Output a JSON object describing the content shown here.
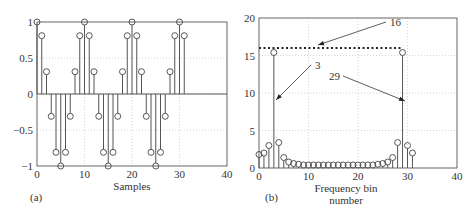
{
  "chart_data": [
    {
      "panel_label": "(a)",
      "type": "stem",
      "title": "",
      "xlabel": "Samples",
      "ylabel": "",
      "xlim": [
        0,
        40
      ],
      "ylim": [
        -1,
        1
      ],
      "xticks": [
        0,
        10,
        20,
        30,
        40
      ],
      "yticks": [
        1,
        0.5,
        0,
        -0.5,
        -1
      ],
      "ytick_labels": [
        "1",
        "0.5",
        "0",
        "−0.5",
        "−1"
      ],
      "grid": true,
      "x": [
        0,
        1,
        2,
        3,
        4,
        5,
        6,
        7,
        8,
        9,
        10,
        11,
        12,
        13,
        14,
        15,
        16,
        17,
        18,
        19,
        20,
        21,
        22,
        23,
        24,
        25,
        26,
        27,
        28,
        29,
        30,
        31
      ],
      "values": [
        1,
        0.81,
        0.31,
        -0.31,
        -0.81,
        -1,
        -0.81,
        -0.31,
        0.31,
        0.81,
        1,
        0.81,
        0.31,
        -0.31,
        -0.81,
        -1,
        -0.81,
        -0.31,
        0.31,
        0.81,
        1,
        0.81,
        0.31,
        -0.31,
        -0.81,
        -1,
        -0.81,
        -0.31,
        0.31,
        0.81,
        1,
        0.81
      ]
    },
    {
      "panel_label": "(b)",
      "type": "stem",
      "title": "",
      "xlabel": "Frequency bin number",
      "xlabel_lines": [
        "Frequency bin",
        "number"
      ],
      "ylabel": "",
      "xlim": [
        0,
        40
      ],
      "ylim": [
        0,
        20
      ],
      "xticks": [
        0,
        10,
        20,
        30,
        40
      ],
      "yticks": [
        20,
        15,
        10,
        5,
        0
      ],
      "grid": true,
      "x": [
        0,
        1,
        2,
        3,
        4,
        5,
        6,
        7,
        8,
        9,
        10,
        11,
        12,
        13,
        14,
        15,
        16,
        17,
        18,
        19,
        20,
        21,
        22,
        23,
        24,
        25,
        26,
        27,
        28,
        29,
        30,
        31
      ],
      "values": [
        1.8,
        2.0,
        3.0,
        15.4,
        3.4,
        1.4,
        0.8,
        0.6,
        0.5,
        0.4,
        0.4,
        0.4,
        0.4,
        0.4,
        0.4,
        0.4,
        0.4,
        0.4,
        0.4,
        0.4,
        0.4,
        0.4,
        0.4,
        0.4,
        0.5,
        0.6,
        0.8,
        1.4,
        3.4,
        15.4,
        3.0,
        2.0
      ],
      "reference_line": {
        "y": 16,
        "x_range": [
          0,
          29
        ],
        "style": "dotted"
      },
      "annotations": [
        {
          "text": "16",
          "text_xy": [
            390,
            22
          ],
          "arrow_to": [
            318,
            45
          ]
        },
        {
          "text": "3",
          "text_xy": [
            315,
            65
          ],
          "arrow_to": [
            276,
            100
          ]
        },
        {
          "text": "29",
          "text_xy": [
            340,
            76
          ],
          "arrow_to": [
            405,
            101
          ]
        }
      ]
    }
  ]
}
